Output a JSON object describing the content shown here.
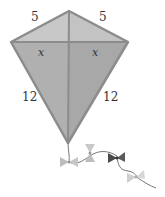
{
  "diagram": {
    "type": "kite",
    "labels": {
      "top_left_side": "5",
      "top_right_side": "5",
      "left_segment": "x",
      "right_segment": "x",
      "bottom_left_side": "12",
      "bottom_right_side": "12"
    },
    "colors": {
      "kite_fill": "#b5b5b5",
      "kite_stroke": "#8c8c8c",
      "tail_light": "#c4c4c4",
      "tail_dark": "#4a4a4a"
    }
  }
}
